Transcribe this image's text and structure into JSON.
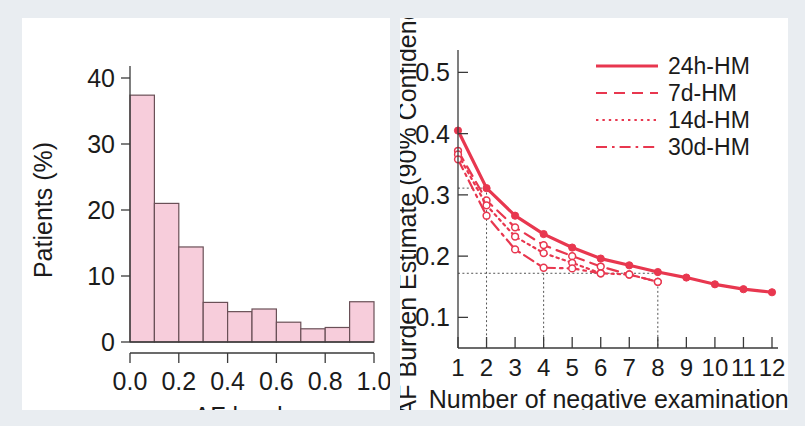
{
  "figure": {
    "background_color": "#e9edf1",
    "panel_background": "#ffffff",
    "accent_color": "#e8374f",
    "bar_fill_color": "#f7cddb",
    "bar_edge_color": "#6a5057"
  },
  "chart_data": [
    {
      "type": "bar",
      "panel": "left",
      "title": "",
      "xlabel": "AF burden",
      "ylabel": "Patients (%)",
      "xlim": [
        0.0,
        1.0
      ],
      "ylim": [
        0,
        40
      ],
      "xticks": [
        "0.0",
        "0.2",
        "0.4",
        "0.6",
        "0.8",
        "1.0"
      ],
      "xtick_values": [
        0.0,
        0.2,
        0.4,
        0.6,
        0.8,
        1.0
      ],
      "yticks": [
        "0",
        "10",
        "20",
        "30",
        "40"
      ],
      "ytick_values": [
        0,
        10,
        20,
        30,
        40
      ],
      "grid": false,
      "legend": "none",
      "bin_edges": [
        0.0,
        0.1,
        0.2,
        0.3,
        0.4,
        0.5,
        0.6,
        0.7,
        0.8,
        0.9,
        1.0
      ],
      "categories": [
        "0.0-0.1",
        "0.1-0.2",
        "0.2-0.3",
        "0.3-0.4",
        "0.4-0.5",
        "0.5-0.6",
        "0.6-0.7",
        "0.7-0.8",
        "0.8-0.9",
        "0.9-1.0"
      ],
      "values": [
        37.4,
        21.0,
        14.4,
        6.0,
        4.6,
        5.0,
        3.0,
        2.0,
        2.2,
        6.1
      ]
    },
    {
      "type": "line",
      "panel": "right",
      "title": "",
      "xlabel": "Number of negative examinations",
      "ylabel": "AF Burden Estimate (90% Confidence)",
      "xlim": [
        1,
        12
      ],
      "ylim": [
        0.05,
        0.53
      ],
      "xticks": [
        "1",
        "2",
        "3",
        "4",
        "5",
        "6",
        "7",
        "8",
        "9",
        "10",
        "11",
        "12"
      ],
      "xtick_values": [
        1,
        2,
        3,
        4,
        5,
        6,
        7,
        8,
        9,
        10,
        11,
        12
      ],
      "yticks": [
        "0.1",
        "0.2",
        "0.3",
        "0.4",
        "0.5"
      ],
      "ytick_values": [
        0.1,
        0.2,
        0.3,
        0.4,
        0.5
      ],
      "grid": false,
      "legend": "top-right",
      "x": [
        1,
        2,
        3,
        4,
        5,
        6,
        7,
        8,
        9,
        10,
        11,
        12
      ],
      "series": [
        {
          "name": "24h-HM",
          "style": "solid",
          "marker": "filled-circle",
          "x": [
            1,
            2,
            3,
            4,
            5,
            6,
            7,
            8,
            9,
            10,
            11,
            12
          ],
          "values": [
            0.405,
            0.311,
            0.266,
            0.236,
            0.214,
            0.196,
            0.185,
            0.174,
            0.165,
            0.154,
            0.146,
            0.141
          ]
        },
        {
          "name": "7d-HM",
          "style": "dashed",
          "marker": "open-circle",
          "x": [
            1,
            2,
            3,
            4,
            5,
            6,
            7,
            8
          ],
          "values": [
            0.372,
            0.291,
            0.247,
            0.218,
            0.2,
            0.183,
            0.17,
            0.158
          ]
        },
        {
          "name": "14d-HM",
          "style": "dotted",
          "marker": "open-circle",
          "x": [
            1,
            2,
            3,
            4,
            5,
            6,
            7,
            8
          ],
          "values": [
            0.366,
            0.283,
            0.232,
            0.205,
            0.189,
            0.172,
            0.17,
            0.158
          ]
        },
        {
          "name": "30d-HM",
          "style": "dashdot",
          "marker": "open-circle",
          "x": [
            1,
            2,
            3,
            4,
            5,
            6
          ],
          "values": [
            0.358,
            0.266,
            0.211,
            0.181,
            0.18,
            0.172
          ]
        }
      ],
      "reference_lines": {
        "vertical_x": [
          2,
          4,
          8
        ],
        "horizontal_y": [
          0.311,
          0.172
        ]
      }
    }
  ],
  "legend": {
    "entries": [
      {
        "label": "24h-HM",
        "style": "solid"
      },
      {
        "label": "7d-HM",
        "style": "dashed"
      },
      {
        "label": "14d-HM",
        "style": "dotted"
      },
      {
        "label": "30d-HM",
        "style": "dashdot"
      }
    ]
  }
}
